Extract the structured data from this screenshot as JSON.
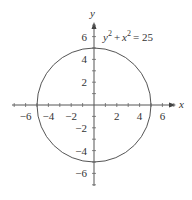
{
  "chart_data": {
    "type": "line",
    "title": "",
    "annotation": "y² + x² = 25",
    "equation": {
      "lhs_y": "y",
      "lhs_x": "x",
      "exp": "2",
      "plus": "+",
      "equals": "= 25"
    },
    "xlabel": "x",
    "ylabel": "y",
    "xlim": [
      -7,
      7
    ],
    "ylim": [
      -7,
      7
    ],
    "xticks": [
      -6,
      -4,
      -2,
      2,
      4,
      6
    ],
    "yticks": [
      6,
      4,
      2,
      -2,
      -4,
      -6
    ],
    "xtick_labels": [
      "−6",
      "−4",
      "−2",
      "2",
      "4",
      "6"
    ],
    "ytick_labels": [
      "6",
      "4",
      "2",
      "−2",
      "−4",
      "−6"
    ],
    "minor_tick_step": 1,
    "grid": false,
    "series": [
      {
        "name": "circle",
        "shape": "circle",
        "center": [
          0,
          0
        ],
        "radius": 5,
        "color": "#555555"
      }
    ]
  }
}
